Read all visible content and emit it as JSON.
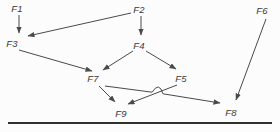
{
  "canvas": {
    "width": 280,
    "height": 132,
    "background": "#fcfcfc"
  },
  "colors": {
    "edge": "#4a4a4a",
    "label": "#3a3a3a",
    "rule": "#303030"
  },
  "diagram": {
    "type": "directed-graph",
    "nodes": [
      {
        "id": "F1",
        "label": "F1",
        "x": 17,
        "y": 8
      },
      {
        "id": "F2",
        "label": "F2",
        "x": 139,
        "y": 9
      },
      {
        "id": "F3",
        "label": "F3",
        "x": 12,
        "y": 43
      },
      {
        "id": "F4",
        "label": "F4",
        "x": 139,
        "y": 45
      },
      {
        "id": "F5",
        "label": "F5",
        "x": 181,
        "y": 78
      },
      {
        "id": "F6",
        "label": "F6",
        "x": 262,
        "y": 10
      },
      {
        "id": "F7",
        "label": "F7",
        "x": 93,
        "y": 78
      },
      {
        "id": "F8",
        "label": "F8",
        "x": 231,
        "y": 112
      },
      {
        "id": "F9",
        "label": "F9",
        "x": 121,
        "y": 113
      }
    ],
    "edges": [
      {
        "from": "F1",
        "to": "F3",
        "x1": 19,
        "y1": 15,
        "x2": 19,
        "y2": 33
      },
      {
        "from": "F2",
        "to": "F3",
        "x1": 131,
        "y1": 13,
        "x2": 28,
        "y2": 36
      },
      {
        "from": "F2",
        "to": "F4",
        "x1": 141,
        "y1": 16,
        "x2": 141,
        "y2": 35
      },
      {
        "from": "F3",
        "to": "F7",
        "x1": 19,
        "y1": 50,
        "x2": 92,
        "y2": 71
      },
      {
        "from": "F4",
        "to": "F7",
        "x1": 133,
        "y1": 51,
        "x2": 103,
        "y2": 70
      },
      {
        "from": "F4",
        "to": "F5",
        "x1": 146,
        "y1": 51,
        "x2": 176,
        "y2": 69
      },
      {
        "from": "F7",
        "to": "F9",
        "x1": 99,
        "y1": 86,
        "x2": 115,
        "y2": 102
      },
      {
        "from": "F5",
        "to": "F9",
        "x1": 177,
        "y1": 85,
        "x2": 128,
        "y2": 104
      },
      {
        "from": "F7",
        "to": "F8",
        "x1": 105,
        "y1": 86,
        "x2": 220,
        "y2": 103,
        "hop": {
          "x": 157.5,
          "y": 93,
          "r": 5.5
        }
      },
      {
        "from": "F6",
        "to": "F8",
        "x1": 266,
        "y1": 19,
        "x2": 236,
        "y2": 100
      }
    ],
    "baseline_rule": {
      "x1": 8,
      "y1": 123,
      "x2": 272,
      "y2": 123,
      "thickness": 2.2
    }
  }
}
